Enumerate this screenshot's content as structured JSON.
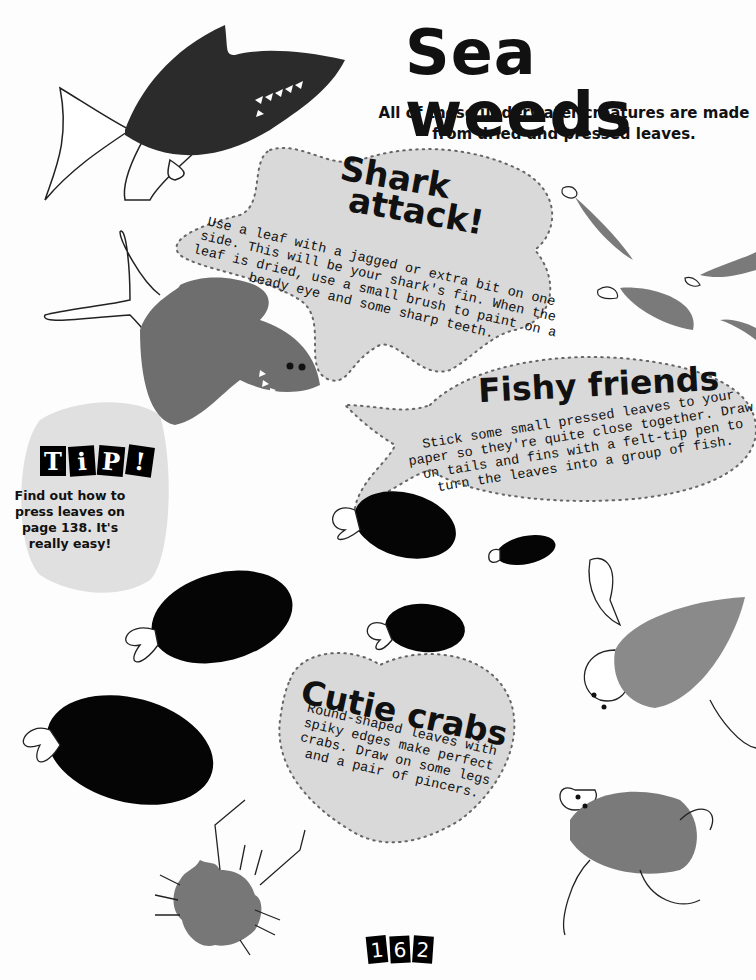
{
  "header": {
    "title": "Sea weeds",
    "subtitle": "All of these underwater creatures are made from dried and pressed leaves."
  },
  "sections": {
    "shark": {
      "heading_line1": "Shark",
      "heading_line2": "attack!",
      "body": "Use a leaf with a jagged or extra bit on one side. This will be your shark's fin. When the leaf is dried, use a small brush to paint on a beady eye and some sharp teeth."
    },
    "fishy": {
      "heading": "Fishy friends",
      "body": "Stick some small pressed leaves to your paper so they're quite close together. Draw on tails and fins with a felt-tip pen to turn the leaves into a group of fish."
    },
    "crabs": {
      "heading": "Cutie crabs",
      "body": "Round-shaped leaves with spiky edges make perfect crabs. Draw on some legs and a pair of pincers."
    }
  },
  "tip": {
    "letters": [
      "T",
      "i",
      "P",
      "!"
    ],
    "body": "Find out how to press leaves on page 138. It's really easy!"
  },
  "page_number_digits": [
    "1",
    "6",
    "2"
  ],
  "colors": {
    "bubble_fill": "#d9d9d9",
    "dots": "#555555",
    "leaf_dark": "#2b2b2b",
    "leaf_mid": "#6e6e6e",
    "leaf_light": "#8a8a8a",
    "fish_black": "#050505"
  }
}
